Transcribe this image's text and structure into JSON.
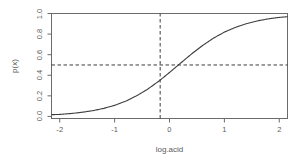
{
  "chart_data": {
    "type": "line",
    "title": "",
    "subtitle": "",
    "xlabel": "log.acid",
    "ylabel": "p(x)",
    "xlim": [
      -2.15,
      2.15
    ],
    "ylim": [
      -0.02,
      1.0
    ],
    "xticks": [
      -2,
      -1,
      0,
      1,
      2
    ],
    "xtick_labels": [
      "-2",
      "-1",
      "0",
      "1",
      "2"
    ],
    "yticks": [
      0.0,
      0.2,
      0.4,
      0.6,
      0.8,
      1.0
    ],
    "ytick_labels": [
      "0.0",
      "0.2",
      "0.4",
      "0.6",
      "0.8",
      "1.0"
    ],
    "grid": false,
    "legend": null,
    "legend_position": "none",
    "series": [
      {
        "name": "logistic curve",
        "style": "solid",
        "color": "#3d3d3d",
        "x": [
          -2.15,
          -2.0,
          -1.8,
          -1.6,
          -1.4,
          -1.2,
          -1.0,
          -0.8,
          -0.6,
          -0.4,
          -0.2,
          -0.17,
          0.0,
          0.2,
          0.4,
          0.6,
          0.8,
          1.0,
          1.2,
          1.4,
          1.6,
          1.8,
          2.0,
          2.15
        ],
        "y": [
          0.017,
          0.02,
          0.028,
          0.04,
          0.056,
          0.078,
          0.108,
          0.148,
          0.2,
          0.264,
          0.341,
          0.353,
          0.427,
          0.517,
          0.606,
          0.688,
          0.76,
          0.819,
          0.865,
          0.901,
          0.928,
          0.948,
          0.962,
          0.969
        ]
      }
    ],
    "reference_lines": [
      {
        "name": "horizontal-threshold",
        "orientation": "horizontal",
        "value": 0.5,
        "style": "dashed",
        "color": "#3d3d3d"
      },
      {
        "name": "vertical-threshold",
        "orientation": "vertical",
        "value": -0.17,
        "style": "dashed",
        "color": "#3d3d3d"
      }
    ],
    "frame": {
      "box": true,
      "color": "#6b6b6b"
    },
    "annotations": []
  },
  "axis_title_x": "log.acid",
  "axis_title_y": "p(x)"
}
